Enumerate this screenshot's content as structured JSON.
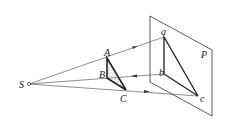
{
  "diagram": {
    "labels": {
      "source": "S",
      "plane": "P",
      "A": "A",
      "B": "B",
      "C": "C",
      "a": "a",
      "b": "b",
      "c": "c"
    },
    "colors": {
      "line": "#333333",
      "background": "#ffffff"
    }
  }
}
